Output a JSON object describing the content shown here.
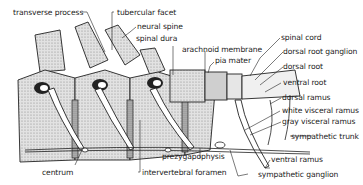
{
  "diagram": {
    "labels": {
      "transverse_process": "transverse process",
      "tubercular_facet": "tubercular facet",
      "neural_spine": "neural spine",
      "spinal_dura": "spinal dura",
      "arachnoid_membrane": "arachnoid membrane",
      "pia_mater": "pia mater",
      "spinal_cord": "spinal cord",
      "dorsal_root_ganglion": "dorsal root ganglion",
      "dorsal_root": "dorsal root",
      "ventral_root": "ventral root",
      "dorsal_ramus": "dorsal ramus",
      "white_visceral_ramus": "white visceral ramus",
      "gray_visceral_ramus": "gray visceral ramus",
      "sympathetic_trunk": "sympathetic trunk",
      "ventral_ramus": "ventral ramus",
      "sympathetic_ganglion": "sympathetic ganglion",
      "prezygapophysis": "prezygapophysis",
      "intervertebral_foramen": "intervertebral foramen",
      "centrum": "centrum"
    },
    "colors": {
      "ink": "#222222",
      "bone_fill": "#d9d9d9",
      "shade": "#9a9a9a",
      "background": "#ffffff"
    }
  }
}
